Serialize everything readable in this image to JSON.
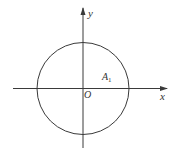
{
  "diagram": {
    "type": "coordinate-circle",
    "colors": {
      "stroke": "#3a3a3a",
      "text": "#333333",
      "background": "#ffffff"
    },
    "axes": {
      "x_label": "x",
      "y_label": "y",
      "origin_label": "O"
    },
    "circle": {
      "center": "O",
      "point_label": "A",
      "point_subscript": "1"
    }
  }
}
